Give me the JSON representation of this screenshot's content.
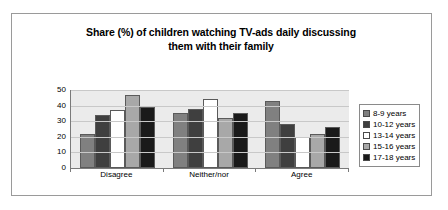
{
  "chart_data": {
    "type": "bar",
    "title": "Share (%) of children watching TV-ads daily discussing them with their family",
    "title_line1": "Share (%) of children watching TV-ads daily discussing",
    "title_line2": "them with their family",
    "xlabel": "",
    "ylabel": "",
    "ylim": [
      0,
      50
    ],
    "yticks": [
      50,
      40,
      30,
      20,
      10,
      0
    ],
    "grid": true,
    "legend_position": "right",
    "categories": [
      "Disagree",
      "Neither/nor",
      "Agree"
    ],
    "series": [
      {
        "name": "8-9 years",
        "color": "#808080",
        "values": [
          22,
          35,
          43
        ]
      },
      {
        "name": "10-12 years",
        "color": "#3f3f3f",
        "values": [
          34,
          38,
          28
        ]
      },
      {
        "name": "13-14 years",
        "color": "#ffffff",
        "values": [
          37,
          44,
          20
        ]
      },
      {
        "name": "15-16 years",
        "color": "#a8a8a8",
        "values": [
          47,
          32,
          22
        ]
      },
      {
        "name": "17-18 years",
        "color": "#1a1a1a",
        "values": [
          39,
          35,
          26
        ]
      }
    ]
  }
}
